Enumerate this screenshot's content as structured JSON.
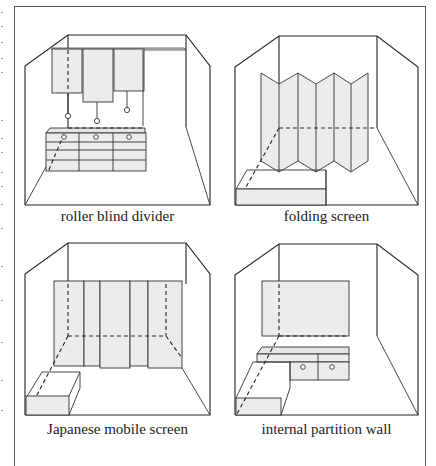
{
  "figure": {
    "panels": [
      {
        "id": "roller-blind-divider",
        "caption": "roller blind divider",
        "fill_color": "#ececec"
      },
      {
        "id": "folding-screen",
        "caption": "folding screen",
        "fill_color": "#ececec"
      },
      {
        "id": "japanese-mobile-screen",
        "caption": "Japanese mobile screen",
        "fill_color": "#ececec"
      },
      {
        "id": "internal-partition-wall",
        "caption": "internal partition wall",
        "fill_color": "#ececec"
      }
    ],
    "line_color": "#222222",
    "frame_color": "#5a5a5a"
  }
}
